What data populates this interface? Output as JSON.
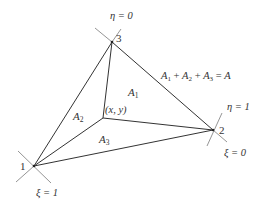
{
  "diagram": {
    "vertices": [
      {
        "id": "1",
        "label": "1",
        "x": 34,
        "y": 166
      },
      {
        "id": "2",
        "label": "2",
        "x": 213,
        "y": 130
      },
      {
        "id": "3",
        "label": "3",
        "x": 112,
        "y": 42
      }
    ],
    "interior_point": {
      "label": "(x, y)",
      "x": 103,
      "y": 118
    },
    "areas": [
      {
        "id": "A1",
        "label": "A",
        "sub": "1"
      },
      {
        "id": "A2",
        "label": "A",
        "sub": "2"
      },
      {
        "id": "A3",
        "label": "A",
        "sub": "3"
      }
    ],
    "equation": {
      "text": "A1 + A2 + A3 = A",
      "parts": [
        "A",
        "1",
        " + ",
        "A",
        "2",
        " + ",
        "A",
        "3",
        " = ",
        "A"
      ]
    },
    "coordinate_labels": {
      "eta0": "η = 0",
      "eta1": "η = 1",
      "xi0": "ξ = 0",
      "xi1": "ξ = 1"
    },
    "colors": {
      "line": "#333333",
      "tick": "#777777",
      "text": "#333333",
      "background": "#ffffff"
    }
  }
}
